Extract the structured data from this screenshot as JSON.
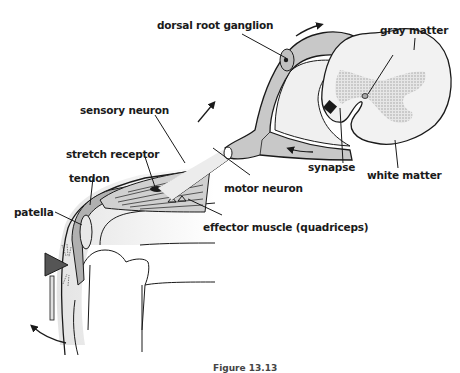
{
  "figure": {
    "caption": "Figure 13.13"
  },
  "labels": {
    "dorsal_root_ganglion": "dorsal root ganglion",
    "gray_matter": "gray matter",
    "sensory_neuron": "sensory neuron",
    "stretch_receptor": "stretch receptor",
    "tendon": "tendon",
    "patella": "patella",
    "motor_neuron": "motor neuron",
    "synapse": "synapse",
    "white_matter": "white matter",
    "effector_muscle": "effector muscle (quadriceps)"
  },
  "colors": {
    "outline": "#1a1a1a",
    "nerve_fill": "#c8c8c8",
    "gray_matter": "#b8b8b8",
    "white_matter": "#f2f2f2",
    "hammer": "#555555"
  }
}
